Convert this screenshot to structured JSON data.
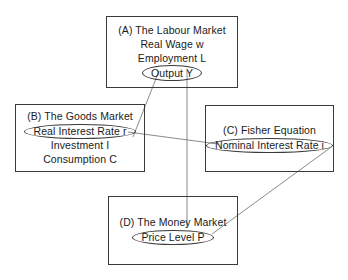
{
  "diagram": {
    "background_color": "#ffffff",
    "line_color": "#3a3a3a",
    "edge_color": "#8a8a8a",
    "nodes": [
      {
        "id": "a",
        "label": "(A) The Labour Market",
        "lines": [
          "(A) The Labour Market",
          "Real Wage w",
          "Employment L"
        ],
        "circled_variable": "Output Y"
      },
      {
        "id": "b",
        "label": "(B) The Goods Market",
        "lines": [
          "(B) The Goods Market"
        ],
        "circled_variable": "Real Interest Rate r",
        "lines_after": [
          "Investment I",
          "Consumption C"
        ]
      },
      {
        "id": "c",
        "label": "(C) Fisher Equation",
        "lines": [
          "(C) Fisher Equation"
        ],
        "circled_variable": "Nominal Interest Rate i"
      },
      {
        "id": "d",
        "label": "(D) The Money Market",
        "lines": [
          "(D) The Money Market"
        ],
        "circled_variable": "Price Level P"
      }
    ],
    "edges": [
      {
        "id": "edge-output-to-goods",
        "from": "Output Y",
        "to": "(B) The Goods Market"
      },
      {
        "id": "edge-output-to-money",
        "from": "(A) The Labour Market",
        "to": "(D) The Money Market"
      },
      {
        "id": "edge-real-rate-to-nominal-rate",
        "from": "Real Interest Rate r",
        "to": "Nominal Interest Rate i"
      },
      {
        "id": "edge-nominal-rate-to-price-level",
        "from": "Nominal Interest Rate i",
        "to": "Price Level P"
      }
    ]
  }
}
